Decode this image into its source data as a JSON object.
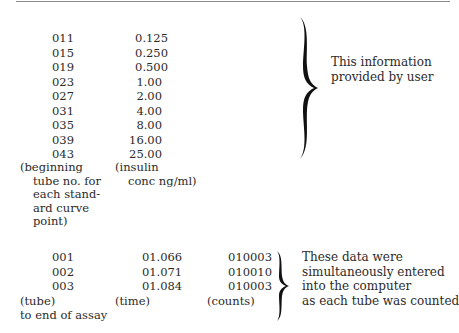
{
  "standard_curve": {
    "rows": [
      {
        "tube": "011",
        "conc": "0.125"
      },
      {
        "tube": "015",
        "conc": "0.250"
      },
      {
        "tube": "019",
        "conc": "0.500"
      },
      {
        "tube": "023",
        "conc": "1.00"
      },
      {
        "tube": "027",
        "conc": "2.00"
      },
      {
        "tube": "031",
        "conc": "4.00"
      },
      {
        "tube": "035",
        "conc": "8.00"
      },
      {
        "tube": "039",
        "conc": "16.00"
      },
      {
        "tube": "043",
        "conc": "25.00"
      }
    ],
    "tube_label": [
      "(beginning",
      "tube no. for",
      "each stand-",
      "ard curve",
      "point)"
    ],
    "conc_label": [
      "(insulin",
      "conc ng/ml)"
    ],
    "note": [
      "This information",
      "provided by user"
    ]
  },
  "assay_data": {
    "rows": [
      {
        "tube": "001",
        "time": "01.066",
        "counts": "010003"
      },
      {
        "tube": "002",
        "time": "01.071",
        "counts": "010010"
      },
      {
        "tube": "003",
        "time": "01.084",
        "counts": "010003"
      }
    ],
    "tube_label": "(tube)",
    "tube_sublabel": "to end of assay",
    "time_label": "(time)",
    "counts_label": "(counts)",
    "note": [
      "These data were",
      "simultaneously entered",
      "into the computer",
      "as each tube was counted"
    ]
  }
}
